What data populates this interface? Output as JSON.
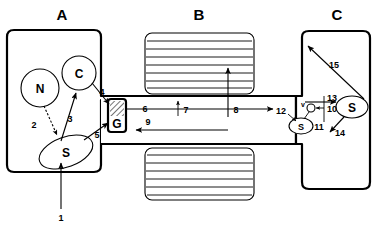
{
  "figure": {
    "width": 377,
    "height": 232,
    "background_color": "#ffffff",
    "line_color": "#000000"
  },
  "sections": [
    {
      "id": "A",
      "label": "A",
      "label_x": 62,
      "label_y": 18
    },
    {
      "id": "B",
      "label": "B",
      "label_x": 198,
      "label_y": 18
    },
    {
      "id": "C",
      "label": "C",
      "label_x": 337,
      "label_y": 18
    }
  ],
  "nodes": [
    {
      "id": "N",
      "label": "N",
      "shape": "circle",
      "cx": 40,
      "cy": 88,
      "r": 19
    },
    {
      "id": "C_node",
      "label": "C",
      "shape": "circle",
      "cx": 79,
      "cy": 73,
      "r": 17
    },
    {
      "id": "S_left",
      "label": "S",
      "shape": "ellipse",
      "cx": 66,
      "cy": 152,
      "rx": 27,
      "ry": 15,
      "rotate": -22
    },
    {
      "id": "G",
      "label": "G",
      "shape": "hatched-box",
      "x": 108,
      "y": 99,
      "w": 17,
      "h": 32
    },
    {
      "id": "S_mid",
      "label": "S",
      "shape": "ellipse",
      "cx": 302,
      "cy": 125,
      "rx": 12,
      "ry": 8
    },
    {
      "id": "S_right",
      "label": "S",
      "shape": "ellipse",
      "cx": 352,
      "cy": 107,
      "rx": 16,
      "ry": 11
    },
    {
      "id": "v_node",
      "label": "v",
      "shape": "small-circle-with-label",
      "cx": 311,
      "cy": 109,
      "r": 4
    }
  ],
  "panels": [
    {
      "id": "B_top",
      "x": 145,
      "y": 33,
      "w": 109,
      "h": 61,
      "stripe_count": 7
    },
    {
      "id": "B_bottom",
      "x": 145,
      "y": 148,
      "w": 109,
      "h": 52,
      "stripe_count": 6
    }
  ],
  "flow_numbers": [
    {
      "id": "1",
      "label": "1",
      "x": 61,
      "y": 218
    },
    {
      "id": "2",
      "label": "2",
      "x": 34,
      "y": 125
    },
    {
      "id": "3",
      "label": "3",
      "x": 69,
      "y": 119
    },
    {
      "id": "4",
      "label": "4",
      "x": 101,
      "y": 93
    },
    {
      "id": "5",
      "label": "5",
      "x": 98,
      "y": 135
    },
    {
      "id": "6",
      "label": "6",
      "x": 143,
      "y": 111
    },
    {
      "id": "7",
      "label": "7",
      "x": 184,
      "y": 110
    },
    {
      "id": "8",
      "label": "8",
      "x": 233,
      "y": 111
    },
    {
      "id": "9",
      "label": "9",
      "x": 149,
      "y": 123
    },
    {
      "id": "10",
      "label": "10",
      "x": 330,
      "y": 110
    },
    {
      "id": "11",
      "label": "11",
      "x": 318,
      "y": 128
    },
    {
      "id": "12",
      "label": "12",
      "x": 282,
      "y": 113
    },
    {
      "id": "13",
      "label": "13",
      "x": 330,
      "y": 100
    },
    {
      "id": "14",
      "label": "14",
      "x": 338,
      "y": 133
    },
    {
      "id": "15",
      "label": "15",
      "x": 333,
      "y": 65
    }
  ],
  "node_labels": {
    "N": "N",
    "C": "C",
    "S": "S",
    "G": "G",
    "v": "v"
  }
}
